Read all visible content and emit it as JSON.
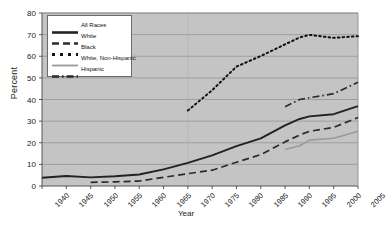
{
  "chart_data": {
    "type": "line",
    "title": "",
    "xlabel": "Year",
    "ylabel": "Percent",
    "xlim": [
      1940,
      2005
    ],
    "ylim": [
      0,
      80
    ],
    "grid": true,
    "legend_position": "upper-left",
    "x_ticks": [
      "1940",
      "1945",
      "1950",
      "1955",
      "1960",
      "1965",
      "1970",
      "1975",
      "1980",
      "1985",
      "1990",
      "1995",
      "2000",
      "2005"
    ],
    "y_ticks": [
      "0",
      "10",
      "20",
      "30",
      "40",
      "50",
      "60",
      "70",
      "80"
    ],
    "series": [
      {
        "name": "All Races",
        "style": "solid",
        "color": "#222222",
        "x": [
          1940,
          1945,
          1950,
          1955,
          1960,
          1965,
          1970,
          1975,
          1980,
          1985,
          1990,
          1993,
          1995,
          2000,
          2005
        ],
        "values": [
          3.8,
          4.6,
          4.0,
          4.5,
          5.3,
          7.7,
          10.7,
          14.2,
          18.4,
          22.0,
          28.0,
          31.0,
          32.2,
          33.2,
          36.9
        ]
      },
      {
        "name": "White",
        "style": "dashed",
        "color": "#2b2b2b",
        "x": [
          1950,
          1955,
          1960,
          1965,
          1970,
          1975,
          1980,
          1985,
          1990,
          1993,
          1995,
          2000,
          2005
        ],
        "values": [
          1.7,
          1.9,
          2.3,
          4.0,
          5.7,
          7.3,
          11.0,
          14.5,
          20.4,
          23.6,
          25.3,
          27.1,
          31.7
        ]
      },
      {
        "name": "Black",
        "style": "dotted",
        "color": "#111111",
        "x": [
          1970,
          1975,
          1980,
          1985,
          1990,
          1993,
          1995,
          2000,
          2005
        ],
        "values": [
          34.9,
          44.3,
          55.2,
          60.1,
          65.5,
          68.7,
          69.9,
          68.5,
          69.3
        ]
      },
      {
        "name": "White, Non-Hispanic",
        "style": "solid-light",
        "color": "#9a9a9a",
        "x": [
          1990,
          1993,
          1995,
          2000,
          2005
        ],
        "values": [
          16.9,
          18.6,
          21.2,
          22.1,
          25.3
        ]
      },
      {
        "name": "Hispanic",
        "style": "dash-dot",
        "color": "#2b2b2b",
        "x": [
          1990,
          1993,
          1995,
          2000,
          2005
        ],
        "values": [
          36.7,
          40.0,
          40.8,
          42.7,
          48.0
        ]
      }
    ]
  },
  "legend": {
    "items": [
      {
        "label": "All Races"
      },
      {
        "label": "White"
      },
      {
        "label": "Black"
      },
      {
        "label": "White, Non-Hispanic"
      },
      {
        "label": "Hispanic"
      }
    ]
  }
}
